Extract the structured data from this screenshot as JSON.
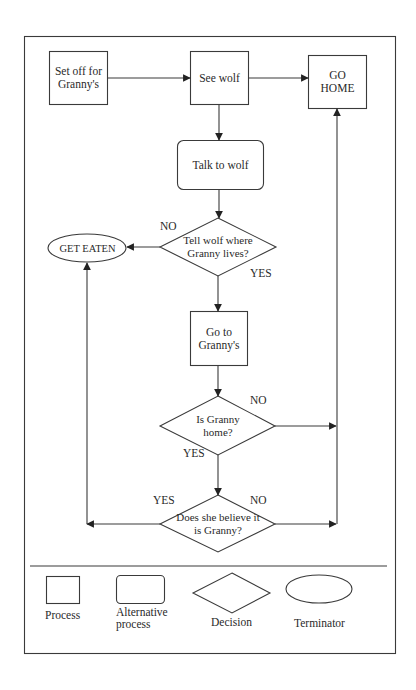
{
  "diagram": {
    "type": "flowchart",
    "colors": {
      "stroke": "#3a3a3a",
      "text": "#2a2a2a",
      "background": "#ffffff"
    },
    "nodes": {
      "set_off": {
        "shape": "process",
        "label": "Set off for Granny's",
        "line1": "Set off for",
        "line2": "Granny's"
      },
      "see_wolf": {
        "shape": "process",
        "label": "See wolf"
      },
      "go_home": {
        "shape": "process",
        "label": "GO HOME",
        "line1": "GO",
        "line2": "HOME"
      },
      "talk_wolf": {
        "shape": "alternative-process",
        "label": "Talk to wolf"
      },
      "tell_wolf": {
        "shape": "decision",
        "label": "Tell wolf where Granny lives?",
        "line1": "Tell wolf where",
        "line2": "Granny lives?"
      },
      "get_eaten": {
        "shape": "terminator",
        "label": "GET EATEN"
      },
      "go_grannys": {
        "shape": "process",
        "label": "Go to Granny's",
        "line1": "Go to",
        "line2": "Granny's"
      },
      "granny_home": {
        "shape": "decision",
        "label": "Is Granny home?",
        "line1": "Is Granny",
        "line2": "home?"
      },
      "believe": {
        "shape": "decision",
        "label": "Does she believe it is Granny?",
        "line1": "Does she believe it",
        "line2": "is Granny?"
      }
    },
    "edge_labels": {
      "tell_no": "NO",
      "tell_yes": "YES",
      "home_no": "NO",
      "home_yes": "YES",
      "believe_yes": "YES",
      "believe_no": "NO"
    },
    "edges": [
      {
        "from": "set_off",
        "to": "see_wolf"
      },
      {
        "from": "see_wolf",
        "to": "go_home"
      },
      {
        "from": "see_wolf",
        "to": "talk_wolf"
      },
      {
        "from": "talk_wolf",
        "to": "tell_wolf"
      },
      {
        "from": "tell_wolf",
        "to": "get_eaten",
        "label": "NO"
      },
      {
        "from": "tell_wolf",
        "to": "go_grannys",
        "label": "YES"
      },
      {
        "from": "go_grannys",
        "to": "granny_home"
      },
      {
        "from": "granny_home",
        "to": "go_home",
        "label": "NO"
      },
      {
        "from": "granny_home",
        "to": "believe",
        "label": "YES"
      },
      {
        "from": "believe",
        "to": "get_eaten",
        "label": "YES"
      },
      {
        "from": "believe",
        "to": "go_home",
        "label": "NO"
      }
    ]
  },
  "legend": {
    "items": [
      {
        "shape": "process",
        "label": "Process"
      },
      {
        "shape": "alternative-process",
        "label": "Alternative process",
        "line1": "Alternative",
        "line2": "process"
      },
      {
        "shape": "decision",
        "label": "Decision"
      },
      {
        "shape": "terminator",
        "label": "Terminator"
      }
    ]
  }
}
